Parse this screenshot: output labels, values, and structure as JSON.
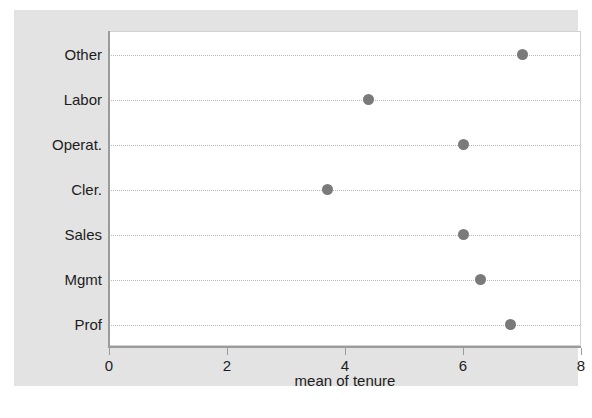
{
  "chart_data": {
    "type": "scatter",
    "orientation": "horizontal",
    "title": "",
    "subtitle": "",
    "xlabel": "mean of tenure",
    "ylabel": "",
    "xlim": [
      0,
      8
    ],
    "xticks": [
      0,
      2,
      4,
      6,
      8
    ],
    "xticklabels": [
      "0",
      "2",
      "4",
      "6",
      "8"
    ],
    "categories": [
      "Other",
      "Labor",
      "Operat.",
      "Cler.",
      "Sales",
      "Mgmt",
      "Prof"
    ],
    "values": [
      7.0,
      4.4,
      6.0,
      3.7,
      6.0,
      6.3,
      6.8
    ],
    "grid": "horizontal-dotted",
    "legend": "none",
    "marker_color": "#7a7a7a",
    "plot_background": "#ffffff",
    "graph_background": "#e3e3e3",
    "points": [
      {
        "category": "Other",
        "value": 7.0
      },
      {
        "category": "Labor",
        "value": 4.4
      },
      {
        "category": "Operat.",
        "value": 6.0
      },
      {
        "category": "Cler.",
        "value": 3.7
      },
      {
        "category": "Sales",
        "value": 6.0
      },
      {
        "category": "Mgmt",
        "value": 6.3
      },
      {
        "category": "Prof",
        "value": 6.8
      }
    ]
  }
}
